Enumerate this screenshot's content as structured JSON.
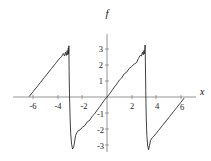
{
  "figure": {
    "title": "f",
    "x_axis_label": "x",
    "background": "#ffffff",
    "curve_color": "#2b2b2b",
    "axis_color": "#7a7a7a"
  },
  "chart_data": {
    "type": "line",
    "title": "f",
    "xlabel": "x",
    "ylabel": "",
    "xlim": [
      -6.9,
      6.9
    ],
    "ylim": [
      -3.6,
      3.6
    ],
    "grid": false,
    "legend": null,
    "xticks": [
      -6,
      -4,
      -2,
      2,
      4,
      6
    ],
    "xticklabels": [
      "-6",
      "-4",
      "-2",
      "2",
      "4",
      "6"
    ],
    "yticks": [
      -3,
      -2,
      -1,
      1,
      2,
      3
    ],
    "yticklabels": [
      "-3",
      "-2",
      "-1",
      "1",
      "2",
      "3"
    ],
    "period": 6.2832,
    "amplitude": 3.0,
    "discontinuities": [
      -3.1416,
      3.1416
    ],
    "series": [
      {
        "name": "f",
        "x": [
          -6.3,
          -6.0,
          -5.7,
          -5.4,
          -5.1,
          -4.8,
          -4.5,
          -4.2,
          -3.9,
          -3.7,
          -3.55,
          -3.45,
          -3.38,
          -3.3,
          -3.24,
          -3.19,
          -3.15,
          -3.12,
          -3.1,
          -3.08,
          -3.05,
          -3.0,
          -2.95,
          -2.88,
          -2.8,
          -2.7,
          -2.55,
          -2.4,
          -2.2,
          -2.0,
          -1.8,
          -1.6,
          -1.4,
          -1.2,
          -1.0,
          -0.8,
          -0.6,
          -0.4,
          -0.2,
          0.0,
          0.2,
          0.4,
          0.6,
          0.8,
          1.0,
          1.2,
          1.4,
          1.6,
          1.8,
          2.0,
          2.2,
          2.4,
          2.55,
          2.7,
          2.8,
          2.88,
          2.95,
          3.0,
          3.05,
          3.08,
          3.1,
          3.12,
          3.15,
          3.19,
          3.24,
          3.3,
          3.38,
          3.45,
          3.55,
          3.7,
          3.9,
          4.2,
          4.5,
          4.8,
          5.1,
          5.4,
          5.7,
          6.0,
          6.25
        ],
        "y": [
          0.05,
          0.34,
          0.63,
          0.92,
          1.21,
          1.5,
          1.79,
          2.08,
          2.37,
          2.52,
          2.72,
          2.56,
          2.8,
          2.6,
          2.9,
          2.64,
          3.05,
          2.7,
          3.2,
          1.6,
          0.2,
          -1.3,
          -2.3,
          -2.95,
          -3.25,
          -3.1,
          -2.4,
          -2.15,
          -2.05,
          -1.9,
          -1.78,
          -1.55,
          -1.45,
          -1.2,
          -1.05,
          -0.82,
          -0.62,
          -0.4,
          -0.18,
          0.0,
          0.18,
          0.4,
          0.62,
          0.82,
          1.05,
          1.2,
          1.45,
          1.55,
          1.78,
          1.9,
          2.05,
          2.15,
          2.4,
          2.6,
          2.56,
          2.8,
          2.64,
          2.9,
          2.7,
          3.05,
          3.25,
          2.2,
          0.4,
          -1.3,
          -2.4,
          -3.0,
          -3.3,
          -3.05,
          -2.7,
          -2.52,
          -2.37,
          -2.08,
          -1.79,
          -1.5,
          -1.21,
          -0.92,
          -0.63,
          -0.34,
          -0.09
        ]
      }
    ]
  }
}
